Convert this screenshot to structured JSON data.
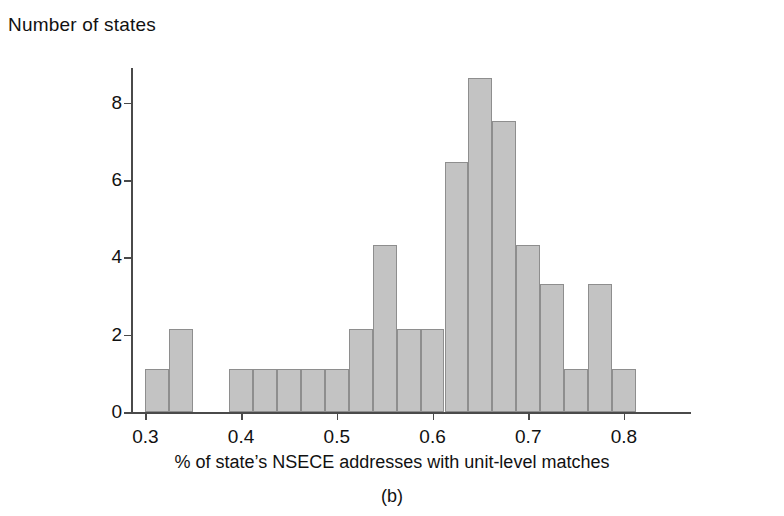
{
  "figure": {
    "ylabel_title": "Number of states",
    "xaxis_title": "% of state’s NSECE addresses with unit-level matches",
    "panel_caption": "(b)",
    "bar_fill": "#c3c3c3",
    "bar_stroke": "#8e8e8e",
    "axis_color": "#4a4a4a"
  },
  "chart_data": {
    "type": "bar",
    "title": "",
    "subtitle": "",
    "xlabel": "% of state’s NSECE addresses with unit-level matches",
    "ylabel": "Number of states",
    "caption": "(b)",
    "xlim": [
      0.285,
      0.87
    ],
    "ylim": [
      0,
      8.9
    ],
    "xticks": [
      0.3,
      0.4,
      0.5,
      0.6,
      0.7,
      0.8
    ],
    "xtick_labels": [
      "0.3",
      "0.4",
      "0.5",
      "0.6",
      "0.7",
      "0.8"
    ],
    "yticks": [
      0,
      2,
      4,
      6,
      8
    ],
    "ytick_labels": [
      "0",
      "2",
      "4",
      "6",
      "8"
    ],
    "grid": false,
    "legend": null,
    "bin_width": 0.025,
    "bins": [
      {
        "x0": 0.3,
        "x1": 0.325,
        "value": 1.1
      },
      {
        "x0": 0.325,
        "x1": 0.35,
        "value": 2.15
      },
      {
        "x0": 0.35,
        "x1": 0.375,
        "value": 0
      },
      {
        "x0": 0.375,
        "x1": 0.3875,
        "value": 0
      },
      {
        "x0": 0.3875,
        "x1": 0.4125,
        "value": 1.1
      },
      {
        "x0": 0.4125,
        "x1": 0.4375,
        "value": 1.1
      },
      {
        "x0": 0.4375,
        "x1": 0.4625,
        "value": 1.1
      },
      {
        "x0": 0.4625,
        "x1": 0.4875,
        "value": 1.1
      },
      {
        "x0": 0.4875,
        "x1": 0.5125,
        "value": 1.1
      },
      {
        "x0": 0.5125,
        "x1": 0.5375,
        "value": 2.15
      },
      {
        "x0": 0.5375,
        "x1": 0.5625,
        "value": 4.33
      },
      {
        "x0": 0.5625,
        "x1": 0.5875,
        "value": 2.15
      },
      {
        "x0": 0.5875,
        "x1": 0.6125,
        "value": 2.15
      },
      {
        "x0": 0.6125,
        "x1": 0.6375,
        "value": 6.47
      },
      {
        "x0": 0.6375,
        "x1": 0.6625,
        "value": 8.63
      },
      {
        "x0": 0.6625,
        "x1": 0.6875,
        "value": 7.52
      },
      {
        "x0": 0.6875,
        "x1": 0.7125,
        "value": 4.33
      },
      {
        "x0": 0.7125,
        "x1": 0.7375,
        "value": 3.3
      },
      {
        "x0": 0.7375,
        "x1": 0.7625,
        "value": 1.1
      },
      {
        "x0": 0.7625,
        "x1": 0.7875,
        "value": 3.3
      },
      {
        "x0": 0.7875,
        "x1": 0.8125,
        "value": 1.1
      }
    ]
  }
}
